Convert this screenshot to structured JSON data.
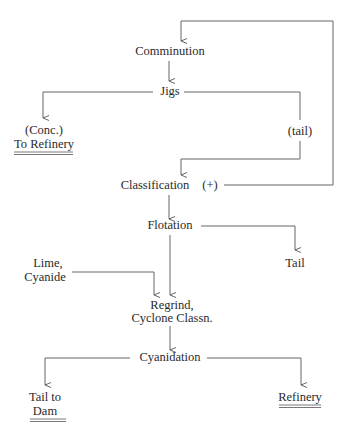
{
  "diagram": {
    "nodes": {
      "comminution": "Comminution",
      "jigs": "Jigs",
      "conc_line1": "(Conc.)",
      "conc_line2": "To Refinery",
      "tail_jigs": "(tail)",
      "classification": "Classification",
      "classification_plus": "(+)",
      "flotation": "Flotation",
      "flotation_tail": "Tail",
      "lime_line1": "Lime,",
      "lime_line2": "Cyanide",
      "regrind_line1": "Regrind,",
      "regrind_line2": "Cyclone Classn.",
      "cyanidation": "Cyanidation",
      "tail_dam_line1": "Tail to",
      "tail_dam_line2": "Dam",
      "refinery": "Refinery"
    },
    "edges": [
      {
        "from": "classification (+)",
        "to": "comminution",
        "label": "recycle"
      },
      {
        "from": "comminution",
        "to": "jigs"
      },
      {
        "from": "jigs",
        "to": "(Conc.) To Refinery"
      },
      {
        "from": "jigs",
        "to": "classification",
        "label": "(tail)"
      },
      {
        "from": "classification",
        "to": "flotation"
      },
      {
        "from": "flotation",
        "to": "Tail"
      },
      {
        "from": "flotation",
        "to": "regrind"
      },
      {
        "from": "Lime, Cyanide",
        "to": "regrind"
      },
      {
        "from": "regrind",
        "to": "cyanidation"
      },
      {
        "from": "cyanidation",
        "to": "Tail to Dam"
      },
      {
        "from": "cyanidation",
        "to": "Refinery"
      }
    ],
    "colors": {
      "line": "#555555",
      "text": "#2a2a2a",
      "background": "#ffffff"
    }
  }
}
